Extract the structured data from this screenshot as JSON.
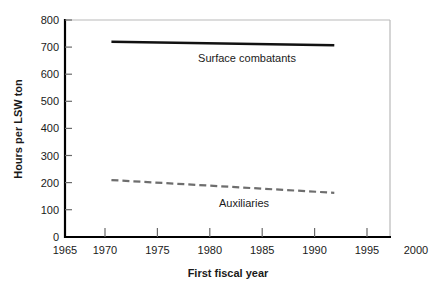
{
  "chart_data": {
    "type": "line",
    "title": "",
    "xlabel": "First fiscal year",
    "ylabel": "Hours per LSW ton",
    "xlim": [
      1965,
      2000
    ],
    "ylim": [
      0,
      800
    ],
    "xticks": [
      1965,
      1970,
      1975,
      1980,
      1985,
      1990,
      1995,
      2000
    ],
    "yticks": [
      0,
      100,
      200,
      300,
      400,
      500,
      600,
      700,
      800
    ],
    "grid": false,
    "legend_position": "inline-annotation",
    "series": [
      {
        "name": "Surface combatants",
        "style": "solid",
        "color": "#111111",
        "x": [
          1970,
          1994
        ],
        "values": [
          720,
          707
        ]
      },
      {
        "name": "Auxiliaries",
        "style": "dashed",
        "color": "#6e6e6e",
        "x": [
          1970,
          1994
        ],
        "values": [
          210,
          163
        ]
      }
    ],
    "annotations": [
      {
        "text": "Surface combatants",
        "x": 1982.2,
        "y": 650
      },
      {
        "text": "Auxiliaries",
        "x": 1981.6,
        "y": 145
      }
    ]
  },
  "axis": {
    "x_title": "First fiscal year",
    "y_title": "Hours per LSW ton",
    "x_tick_labels": [
      "1965",
      "1970",
      "1975",
      "1980",
      "1985",
      "1990",
      "1995",
      "2000"
    ],
    "y_tick_labels": [
      "0",
      "100",
      "200",
      "300",
      "400",
      "500",
      "600",
      "700",
      "800"
    ]
  },
  "labels": {
    "surface_combatants": "Surface combatants",
    "auxiliaries": "Auxiliaries"
  },
  "colors": {
    "surface_combatants_line": "#111111",
    "auxiliaries_line": "#6e6e6e",
    "axis": "#000000",
    "frame": "#b9b9b9",
    "background": "#ffffff"
  }
}
